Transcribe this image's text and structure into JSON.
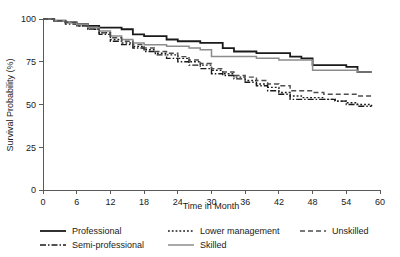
{
  "chart_data": {
    "type": "line",
    "title": "",
    "subtitle": "",
    "xlabel": "Time in Month",
    "ylabel": "Survival Probability (%)",
    "xlim": [
      0,
      60
    ],
    "ylim": [
      0,
      100
    ],
    "xticks": [
      0,
      6,
      12,
      18,
      24,
      30,
      36,
      42,
      48,
      54,
      60
    ],
    "xtick_labels": [
      "0",
      "6",
      "12",
      "18",
      "24",
      "30",
      "36",
      "42",
      "48",
      "54",
      "60"
    ],
    "yticks": [
      0,
      25,
      50,
      75,
      100
    ],
    "ytick_labels": [
      "0",
      "25",
      "50",
      "75",
      "100"
    ],
    "grid": false,
    "legend_position": "below-axes",
    "curve_style": "step (Kaplan-Meier)",
    "series": [
      {
        "name": "Professional",
        "style": "solid",
        "color": "#1a1a1a",
        "width": 1.8,
        "dash": "none",
        "x": [
          0,
          2,
          4,
          6,
          8,
          10,
          12,
          14,
          16,
          18,
          20,
          22,
          24,
          26,
          28,
          30,
          32,
          34,
          36,
          38,
          40,
          42,
          44,
          46,
          48,
          50,
          52,
          54,
          56,
          58.5
        ],
        "y": [
          100,
          99,
          98,
          97,
          96,
          95,
          95,
          94,
          91,
          90,
          90,
          88,
          87,
          87,
          86,
          86,
          83,
          81,
          81,
          80,
          80,
          80,
          78,
          77,
          73,
          73,
          73,
          72,
          69,
          69
        ]
      },
      {
        "name": "Semi-professional",
        "style": "dash-dot",
        "color": "#1a1a1a",
        "width": 1.4,
        "dash": "6,2,1.5,2",
        "x": [
          0,
          2,
          4,
          6,
          8,
          10,
          12,
          14,
          16,
          18,
          20,
          22,
          24,
          26,
          28,
          30,
          32,
          34,
          36,
          38,
          40,
          42,
          44,
          46,
          48,
          50,
          52,
          54,
          56,
          58.5
        ],
        "y": [
          100,
          99,
          97,
          96,
          94,
          91,
          87,
          85,
          83,
          81,
          79,
          77,
          75,
          73,
          71,
          68,
          67,
          65,
          63,
          61,
          58,
          56,
          53,
          53,
          53,
          53,
          52,
          50,
          49,
          49
        ]
      },
      {
        "name": "Lower management",
        "style": "dotted",
        "color": "#1a1a1a",
        "width": 1.4,
        "dash": "1.8,2",
        "x": [
          0,
          2,
          4,
          6,
          8,
          10,
          12,
          14,
          16,
          18,
          20,
          22,
          24,
          26,
          28,
          30,
          32,
          34,
          36,
          38,
          40,
          42,
          44,
          46,
          48,
          50,
          52,
          54,
          56,
          58.5
        ],
        "y": [
          100,
          99,
          98,
          96,
          94,
          92,
          88,
          86,
          84,
          82,
          80,
          79,
          77,
          75,
          73,
          70,
          68,
          66,
          64,
          62,
          60,
          57,
          55,
          54,
          54,
          53,
          52,
          51,
          50,
          49
        ]
      },
      {
        "name": "Skilled",
        "style": "solid",
        "color": "#8c8c8c",
        "width": 1.5,
        "dash": "none",
        "x": [
          0,
          2,
          4,
          6,
          8,
          10,
          12,
          14,
          16,
          18,
          20,
          22,
          24,
          26,
          28,
          30,
          32,
          34,
          36,
          38,
          40,
          42,
          44,
          46,
          48,
          50,
          52,
          54,
          56,
          58.5
        ],
        "y": [
          100,
          99,
          98,
          97,
          95,
          93,
          90,
          88,
          86,
          85,
          85,
          84,
          84,
          83,
          82,
          78,
          78,
          78,
          78,
          77,
          77,
          76,
          76,
          76,
          70,
          70,
          70,
          70,
          69,
          69
        ]
      },
      {
        "name": "Unskilled",
        "style": "dashed",
        "color": "#4d4d4d",
        "width": 1.4,
        "dash": "5,3",
        "x": [
          0,
          2,
          4,
          6,
          8,
          10,
          12,
          14,
          16,
          18,
          20,
          22,
          24,
          26,
          28,
          30,
          32,
          34,
          36,
          38,
          40,
          42,
          44,
          46,
          48,
          50,
          52,
          54,
          56,
          58.5
        ],
        "y": [
          100,
          99,
          98,
          96,
          94,
          92,
          89,
          87,
          85,
          83,
          81,
          80,
          78,
          76,
          74,
          71,
          69,
          67,
          66,
          64,
          62,
          61,
          58,
          58,
          57,
          56,
          56,
          56,
          55,
          55
        ]
      }
    ]
  },
  "legend": {
    "entries": [
      {
        "label": "Professional",
        "style": "solid",
        "color": "#1a1a1a",
        "column": 1,
        "row": 1
      },
      {
        "label": "Semi-professional",
        "style": "dash-dot",
        "color": "#1a1a1a",
        "column": 1,
        "row": 2
      },
      {
        "label": "Lower management",
        "style": "dotted",
        "color": "#1a1a1a",
        "column": 2,
        "row": 1
      },
      {
        "label": "Skilled",
        "style": "solid",
        "color": "#8c8c8c",
        "column": 2,
        "row": 2
      },
      {
        "label": "Unskilled",
        "style": "dashed",
        "color": "#4d4d4d",
        "column": 3,
        "row": 1
      }
    ]
  },
  "axes": {
    "x_title": "Time in Month",
    "y_title": "Survival Probability (%)"
  }
}
